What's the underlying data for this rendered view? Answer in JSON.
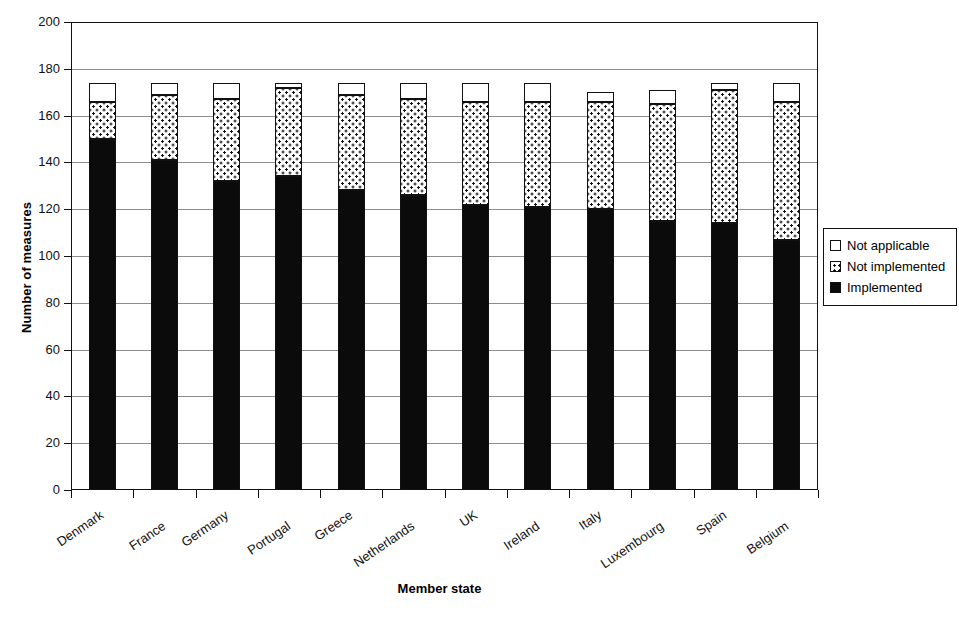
{
  "chart_data": {
    "type": "bar",
    "subtype": "stacked-vertical",
    "title": "",
    "xlabel": "Member state",
    "ylabel": "Number of measures",
    "ylim": [
      0,
      200
    ],
    "ytick_step": 20,
    "yticks": [
      200,
      180,
      160,
      140,
      120,
      100,
      80,
      60,
      40,
      20,
      0
    ],
    "grid": true,
    "grid_axis": "y",
    "legend_position": "right",
    "categories": [
      "Denmark",
      "France",
      "Germany",
      "Portugal",
      "Greece",
      "Netherlands",
      "UK",
      "Ireland",
      "Italy",
      "Luxembourg",
      "Spain",
      "Belgium"
    ],
    "series": [
      {
        "name": "Implemented",
        "color": "#0b0b0b",
        "fill": "solid-black",
        "values": [
          150,
          141,
          132,
          134,
          128,
          126,
          122,
          121,
          120,
          115,
          114,
          107
        ]
      },
      {
        "name": "Not implemented",
        "color": "#ffffff",
        "fill": "dotted",
        "values": [
          16,
          28,
          35,
          38,
          41,
          41,
          44,
          45,
          46,
          50,
          57,
          59
        ]
      },
      {
        "name": "Not applicable",
        "color": "#ffffff",
        "fill": "white",
        "values": [
          8,
          5,
          7,
          2,
          5,
          7,
          8,
          8,
          4,
          6,
          3,
          8
        ]
      }
    ],
    "totals": [
      174,
      174,
      174,
      174,
      174,
      174,
      174,
      174,
      170,
      171,
      174,
      174
    ]
  },
  "axes": {
    "y_title": "Number of measures",
    "x_title": "Member state"
  },
  "legend": {
    "items": [
      {
        "label": "Not applicable",
        "swatch": "white-square-icon"
      },
      {
        "label": "Not implemented",
        "swatch": "dotted-square-icon"
      },
      {
        "label": "Implemented",
        "swatch": "black-square-icon"
      }
    ]
  }
}
